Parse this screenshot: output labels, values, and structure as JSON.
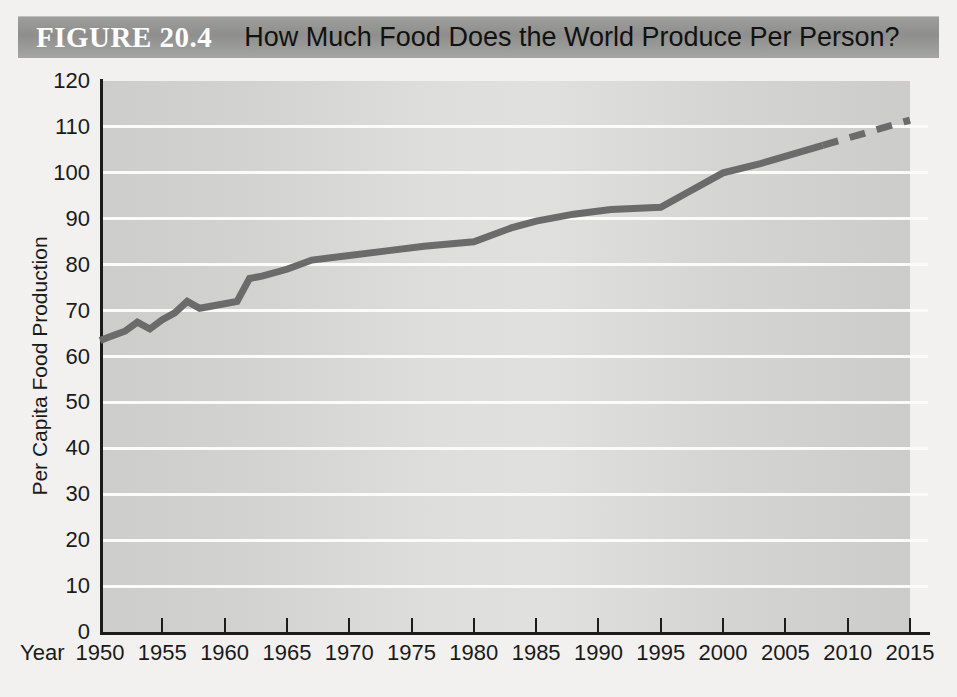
{
  "header": {
    "figure_number": "FIGURE 20.4",
    "title": "How Much Food Does the World Produce Per Person?",
    "bar_color": "#949492",
    "figure_number_color": "#ffffff",
    "title_color": "#111111"
  },
  "axes": {
    "x_caption": "Year",
    "y_title": "Per Capita Food Production"
  },
  "chart_data": {
    "type": "line",
    "title": "How Much Food Does the World Produce Per Person?",
    "xlabel": "Year",
    "ylabel": "Per Capita Food Production",
    "xlim": [
      1950,
      2015
    ],
    "ylim": [
      0,
      120
    ],
    "x_ticks": [
      1950,
      1955,
      1960,
      1965,
      1970,
      1975,
      1980,
      1985,
      1990,
      1995,
      2000,
      2005,
      2010,
      2015
    ],
    "y_ticks": [
      0,
      10,
      20,
      30,
      40,
      50,
      60,
      70,
      80,
      90,
      100,
      110,
      120
    ],
    "grid": "horizontal",
    "legend": "none",
    "line_color": "#6b6b6b",
    "line_width": 7,
    "plot_background": "#d6d6d4",
    "gridline_color": "#fbfbf9",
    "series": [
      {
        "name": "Per Capita Food Production (solid, observed)",
        "style": "solid",
        "x": [
          1950,
          1951,
          1952,
          1953,
          1954,
          1955,
          1956,
          1957,
          1958,
          1959,
          1960,
          1961,
          1962,
          1963,
          1965,
          1967,
          1970,
          1973,
          1976,
          1980,
          1983,
          1985,
          1988,
          1991,
          1995,
          1997,
          2000,
          2003,
          2008
        ],
        "values": [
          63.5,
          64.5,
          65.5,
          67.5,
          66.0,
          68.0,
          69.5,
          72.0,
          70.5,
          71.0,
          71.5,
          72.0,
          77.0,
          77.5,
          79.0,
          81.0,
          82.0,
          83.0,
          84.0,
          85.0,
          88.0,
          89.5,
          91.0,
          92.0,
          92.5,
          95.5,
          100.0,
          102.0,
          106.0
        ]
      },
      {
        "name": "Per Capita Food Production (dashed, projected)",
        "style": "dashed",
        "x": [
          2008,
          2015
        ],
        "values": [
          106.0,
          111.5
        ]
      }
    ]
  }
}
